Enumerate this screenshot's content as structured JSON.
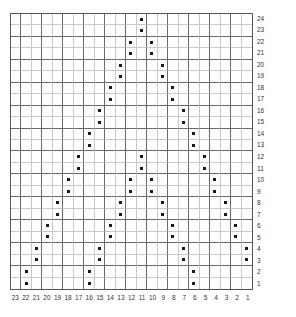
{
  "chart_data": {
    "type": "scatter",
    "title": "",
    "subtitle": "",
    "xlabel": "",
    "ylabel": "",
    "grid": true,
    "legend": null,
    "x_tick_labels": [
      23,
      22,
      21,
      20,
      19,
      18,
      17,
      16,
      15,
      14,
      13,
      12,
      11,
      10,
      9,
      8,
      7,
      6,
      5,
      4,
      3,
      2,
      1
    ],
    "y_tick_labels": [
      24,
      23,
      22,
      21,
      20,
      19,
      18,
      17,
      16,
      15,
      14,
      13,
      12,
      11,
      10,
      9,
      8,
      7,
      6,
      5,
      4,
      3,
      2,
      1
    ],
    "x_columns": 23,
    "y_rows": 24,
    "xlim": [
      23,
      1
    ],
    "ylim": [
      1,
      24
    ],
    "marker": "square-dot",
    "marker_color": "#1a1a1a",
    "grid_line_color": "#c9c9c9",
    "grid_major_color": "#6a6a6a",
    "border_color": "#555555",
    "points": [
      {
        "y": 24,
        "x": [
          11
        ]
      },
      {
        "y": 23,
        "x": [
          11
        ]
      },
      {
        "y": 22,
        "x": [
          12,
          10
        ]
      },
      {
        "y": 21,
        "x": [
          12,
          10
        ]
      },
      {
        "y": 20,
        "x": [
          13,
          9
        ]
      },
      {
        "y": 19,
        "x": [
          13,
          9
        ]
      },
      {
        "y": 18,
        "x": [
          14,
          8
        ]
      },
      {
        "y": 17,
        "x": [
          14,
          8
        ]
      },
      {
        "y": 16,
        "x": [
          15,
          7
        ]
      },
      {
        "y": 15,
        "x": [
          15,
          7
        ]
      },
      {
        "y": 14,
        "x": [
          16,
          6
        ]
      },
      {
        "y": 13,
        "x": [
          16,
          6
        ]
      },
      {
        "y": 12,
        "x": [
          17,
          11,
          5
        ]
      },
      {
        "y": 11,
        "x": [
          17,
          11,
          5
        ]
      },
      {
        "y": 10,
        "x": [
          18,
          12,
          10,
          4
        ]
      },
      {
        "y": 9,
        "x": [
          18,
          12,
          10,
          4
        ]
      },
      {
        "y": 8,
        "x": [
          19,
          13,
          9,
          3
        ]
      },
      {
        "y": 7,
        "x": [
          19,
          13,
          9,
          3
        ]
      },
      {
        "y": 6,
        "x": [
          20,
          14,
          8,
          2
        ]
      },
      {
        "y": 5,
        "x": [
          20,
          14,
          8,
          2
        ]
      },
      {
        "y": 4,
        "x": [
          21,
          15,
          7,
          1
        ]
      },
      {
        "y": 3,
        "x": [
          21,
          15,
          7,
          1
        ]
      },
      {
        "y": 2,
        "x": [
          22,
          16,
          6
        ]
      },
      {
        "y": 1,
        "x": [
          22,
          16,
          6
        ]
      }
    ]
  }
}
